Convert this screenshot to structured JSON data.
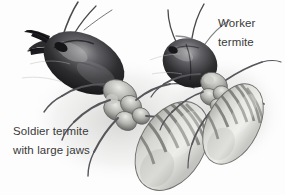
{
  "figure": {
    "type": "scientific-illustration",
    "style": "grayscale pen-and-ink drawing",
    "background_color": "#fdfdfd",
    "text_color": "#3a3a3a",
    "width": 285,
    "height": 195
  },
  "labels": {
    "soldier": {
      "line1": "Soldier termite",
      "line2": "with large jaws"
    },
    "worker": {
      "line1": "Worker",
      "line2": "termite"
    }
  },
  "specimens": [
    {
      "name": "soldier-termite",
      "caste": "soldier",
      "orientation": "diagonal, head upper-left",
      "parts": [
        "mandibles",
        "head",
        "antennae",
        "thorax",
        "legs",
        "abdomen"
      ],
      "head_color": "#2b2b2d",
      "abdomen_color": "#d7d7d4",
      "feature": "large jaws"
    },
    {
      "name": "worker-termite",
      "caste": "worker",
      "orientation": "diagonal, head upper-left",
      "parts": [
        "head",
        "antennae",
        "thorax",
        "legs",
        "abdomen"
      ],
      "head_color": "#2f2f31",
      "abdomen_color": "#dcdcd9",
      "feature": "rounded head"
    }
  ],
  "palette": {
    "ink_darkest": "#1d1d1f",
    "ink_dark": "#3b3b3e",
    "ink_mid": "#79797c",
    "ink_light": "#b4b4b2",
    "body_pale": "#e3e3df",
    "highlight": "#f2f2f0",
    "background": "#fdfdfd"
  }
}
